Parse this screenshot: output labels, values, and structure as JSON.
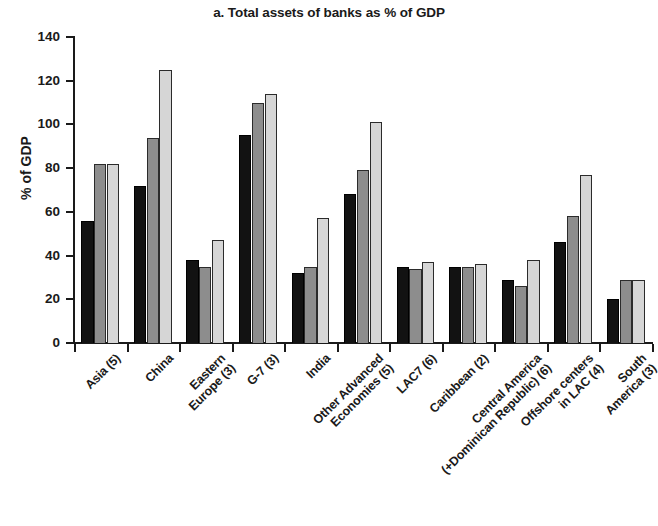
{
  "chart_data": {
    "type": "bar",
    "title": "a. Total assets of banks as % of GDP",
    "xlabel": "",
    "ylabel": "% of GDP",
    "ylim": [
      0,
      140
    ],
    "yticks": [
      0,
      20,
      40,
      60,
      80,
      100,
      120,
      140
    ],
    "grid": false,
    "legend": "none",
    "categories": [
      "Asia (5)",
      "China",
      "Eastern\nEurope (3)",
      "G-7 (3)",
      "India",
      "Other Advanced\nEconomies (5)",
      "LAC7 (6)",
      "Caribbean (2)",
      "Central America\n(+Dominican Republic) (6)",
      "Offshore centers\nin LAC (4)",
      "South\nAmerica (3)"
    ],
    "series": [
      {
        "name": "series-1",
        "color": "#121212",
        "values": [
          56,
          72,
          38,
          95,
          32,
          68,
          35,
          35,
          29,
          46,
          20
        ]
      },
      {
        "name": "series-2",
        "color": "#8d8d8d",
        "values": [
          82,
          94,
          35,
          110,
          35,
          79,
          34,
          35,
          26,
          58,
          29
        ]
      },
      {
        "name": "series-3",
        "color": "#d6d6d6",
        "values": [
          82,
          125,
          47,
          114,
          57,
          101,
          37,
          36,
          38,
          77,
          29
        ]
      }
    ]
  }
}
